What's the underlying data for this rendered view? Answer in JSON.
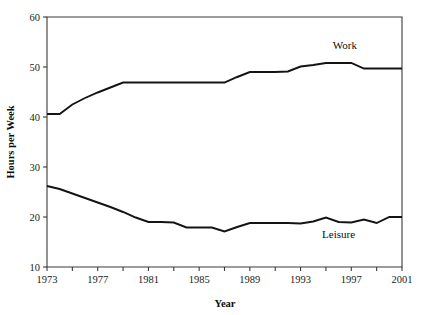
{
  "chart_data": {
    "type": "line",
    "title": "",
    "xlabel": "Year",
    "ylabel": "Hours per Week",
    "xlim": [
      1973,
      2001
    ],
    "ylim": [
      10,
      60
    ],
    "grid": false,
    "legend_position": "inline-annotation",
    "x_ticks_major": [
      1973,
      1977,
      1981,
      1985,
      1989,
      1993,
      1997,
      2001
    ],
    "x_ticks_minor": [
      1975,
      1979,
      1983,
      1987,
      1991,
      1995,
      1999
    ],
    "x_tick_labels": [
      "1973",
      "1977",
      "1981",
      "1985",
      "1989",
      "1993",
      "1997",
      "2001"
    ],
    "y_ticks": [
      10,
      20,
      30,
      40,
      50,
      60
    ],
    "y_tick_labels": [
      "10",
      "20",
      "30",
      "40",
      "50",
      "60"
    ],
    "x": [
      1973,
      1974,
      1975,
      1976,
      1977,
      1978,
      1979,
      1980,
      1981,
      1982,
      1983,
      1984,
      1985,
      1986,
      1987,
      1988,
      1989,
      1990,
      1991,
      1992,
      1993,
      1994,
      1995,
      1996,
      1997,
      1998,
      1999,
      2000,
      2001
    ],
    "series": [
      {
        "name": "Work",
        "label": "Work",
        "color": "#141414",
        "values": [
          40.6,
          40.6,
          42.5,
          43.8,
          44.9,
          45.9,
          46.9,
          46.9,
          46.9,
          46.9,
          46.9,
          46.9,
          46.9,
          46.9,
          46.9,
          48.0,
          49.0,
          49.0,
          49.0,
          49.1,
          50.1,
          50.4,
          50.8,
          50.8,
          50.8,
          49.7,
          49.7,
          49.7,
          49.7
        ]
      },
      {
        "name": "Leisure",
        "label": "Leisure",
        "color": "#141414",
        "values": [
          26.2,
          25.6,
          24.7,
          23.8,
          22.9,
          22.0,
          21.0,
          19.9,
          19.0,
          19.0,
          18.9,
          17.9,
          17.9,
          17.9,
          17.1,
          18.0,
          18.8,
          18.8,
          18.8,
          18.8,
          18.7,
          19.1,
          19.9,
          19.0,
          18.9,
          19.5,
          18.8,
          20.0,
          20.0
        ]
      }
    ],
    "annotations": [
      {
        "text": "Work",
        "x": 1996.5,
        "y": 53.6
      },
      {
        "text": "Leisure",
        "x": 1996.0,
        "y": 15.9
      }
    ]
  }
}
